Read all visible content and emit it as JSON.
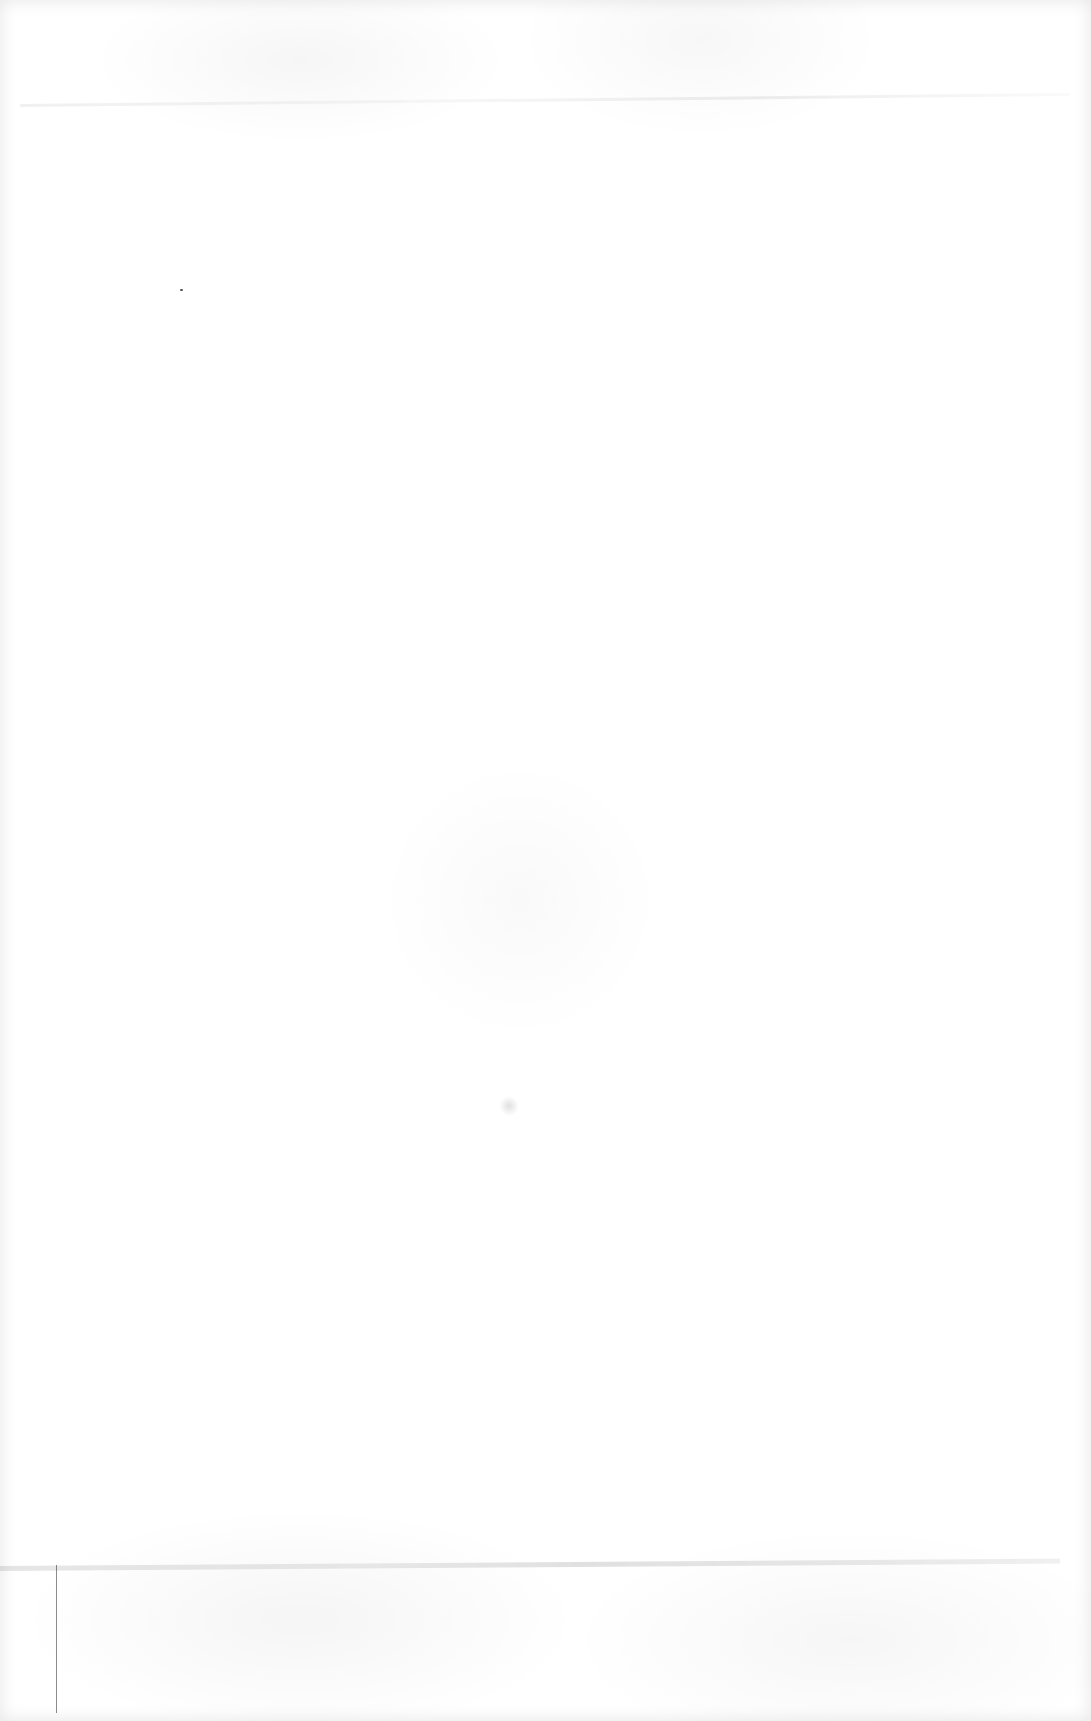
{
  "page": {
    "type": "blank scanned page",
    "text_content": [],
    "background_color": "#ffffff",
    "artifacts": [
      {
        "kind": "horizontal-streak",
        "position": "top"
      },
      {
        "kind": "horizontal-streak",
        "position": "bottom"
      },
      {
        "kind": "speck",
        "position": "upper-left"
      },
      {
        "kind": "vertical-line",
        "position": "bottom-left"
      },
      {
        "kind": "smudge",
        "position": "center"
      }
    ]
  }
}
